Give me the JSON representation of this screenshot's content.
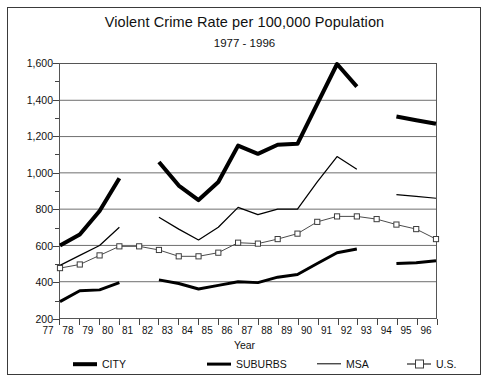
{
  "chart_data": {
    "type": "line",
    "title": "Violent Crime Rate per 100,000 Population",
    "subtitle": "1977 - 1996",
    "xlabel": "Year",
    "ylabel": "",
    "xlim": [
      1977,
      1996
    ],
    "ylim": [
      200,
      1600
    ],
    "ytick_values": [
      200,
      400,
      600,
      800,
      1000,
      1200,
      1400,
      1600
    ],
    "ytick_labels": [
      "200",
      "400",
      "600",
      "800",
      "1,000",
      "1,200",
      "1,400",
      "1,600"
    ],
    "yminor_step": 100,
    "grid": true,
    "legend_position": "bottom",
    "x": [
      1977,
      1978,
      1979,
      1980,
      1981,
      1982,
      1983,
      1984,
      1985,
      1986,
      1987,
      1988,
      1989,
      1990,
      1991,
      1992,
      1993,
      1994,
      1995,
      1996
    ],
    "categories": [
      "77",
      "78",
      "79",
      "80",
      "81",
      "82",
      "83",
      "84",
      "85",
      "86",
      "87",
      "88",
      "89",
      "90",
      "91",
      "92",
      "93",
      "94",
      "95",
      "96"
    ],
    "series": [
      {
        "name": "CITY",
        "style": "thick-solid",
        "values": [
          600,
          660,
          790,
          970,
          null,
          1060,
          930,
          850,
          950,
          1150,
          1105,
          1155,
          1160,
          1380,
          1600,
          1475,
          null,
          1310,
          1290,
          1270
        ]
      },
      {
        "name": "SUBURBS",
        "style": "medium-solid",
        "values": [
          290,
          350,
          355,
          395,
          null,
          410,
          390,
          360,
          380,
          400,
          395,
          425,
          440,
          500,
          560,
          580,
          null,
          500,
          505,
          515
        ]
      },
      {
        "name": "MSA",
        "style": "thin-solid",
        "values": [
          490,
          545,
          600,
          700,
          null,
          755,
          690,
          630,
          700,
          810,
          770,
          800,
          800,
          950,
          1090,
          1020,
          null,
          880,
          870,
          860
        ]
      },
      {
        "name": "U.S.",
        "style": "thin-square-marker",
        "values": [
          475,
          495,
          545,
          595,
          595,
          575,
          540,
          540,
          560,
          615,
          610,
          635,
          665,
          730,
          760,
          760,
          745,
          715,
          690,
          635
        ]
      }
    ]
  },
  "legend": {
    "items": [
      {
        "label": "CITY",
        "icon": "thick-line-swatch"
      },
      {
        "label": "SUBURBS",
        "icon": "medium-line-swatch"
      },
      {
        "label": "MSA",
        "icon": "thin-line-swatch"
      },
      {
        "label": "U.S.",
        "icon": "square-marker-line-swatch"
      }
    ]
  },
  "colors": {
    "series_line": "#000000",
    "us_line": "#4a4a4a",
    "gridline": "#6e6e6e",
    "frame": "#3a3a3a",
    "background": "#ffffff"
  }
}
